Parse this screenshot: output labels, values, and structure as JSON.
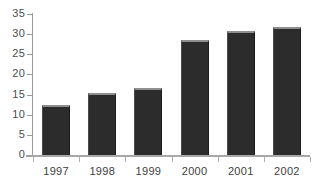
{
  "chart_data": {
    "type": "bar",
    "title": "",
    "subtitle": "",
    "xlabel": "",
    "ylabel": "",
    "categories": [
      "1997",
      "1998",
      "1999",
      "2000",
      "2001",
      "2002"
    ],
    "values": [
      12.5,
      15.5,
      16.7,
      28.6,
      30.9,
      31.9
    ],
    "ylim": [
      0,
      35
    ],
    "ytick_step": 5,
    "ytick_labels": [
      "0",
      "5",
      "10",
      "15",
      "20",
      "25",
      "30",
      "35"
    ],
    "ytick_values": [
      0,
      5,
      10,
      15,
      20,
      25,
      30,
      35
    ],
    "grid": false,
    "legend": null,
    "legend_position": "none",
    "annotations": [],
    "series": [
      {
        "name": "",
        "values": [
          12.5,
          15.5,
          16.7,
          28.6,
          30.9,
          31.9
        ]
      }
    ],
    "colors": {
      "bar_fill": "#2c2c2c",
      "bar_top_highlight": "#8e8e8e",
      "axis": "#9a9a9a",
      "tick": "#b0b0b0",
      "label_text": "#3d3d3d",
      "background": "#ffffff"
    }
  }
}
